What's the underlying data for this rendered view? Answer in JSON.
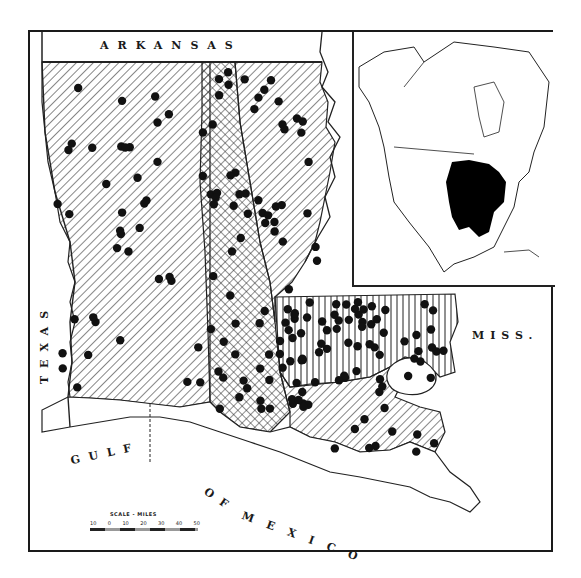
{
  "map": {
    "subject": "Louisiana distribution map with parish hatching and locality dots",
    "labels": {
      "north": "ARKANSAS",
      "west": "TEXAS",
      "east": "MISS.",
      "gulf_1": "GULF",
      "gulf_2": "OF",
      "gulf_3": "MEXICO"
    },
    "scale": {
      "title": "SCALE - MILES",
      "ticks": [
        "10",
        "0",
        "10",
        "20",
        "30",
        "40",
        "50"
      ]
    },
    "legend_patterns": [
      {
        "name": "diagonal-hatch",
        "region": "western and central parishes"
      },
      {
        "name": "cross-hatch",
        "region": "central north-south band"
      },
      {
        "name": "vertical-hatch",
        "region": "southeastern Florida parishes"
      }
    ],
    "inset": {
      "title": "North America",
      "highlight_color": "#000000",
      "highlight_region": "Eastern United States range"
    },
    "colors": {
      "ink": "#1a1a1a",
      "paper": "#ffffff"
    }
  }
}
